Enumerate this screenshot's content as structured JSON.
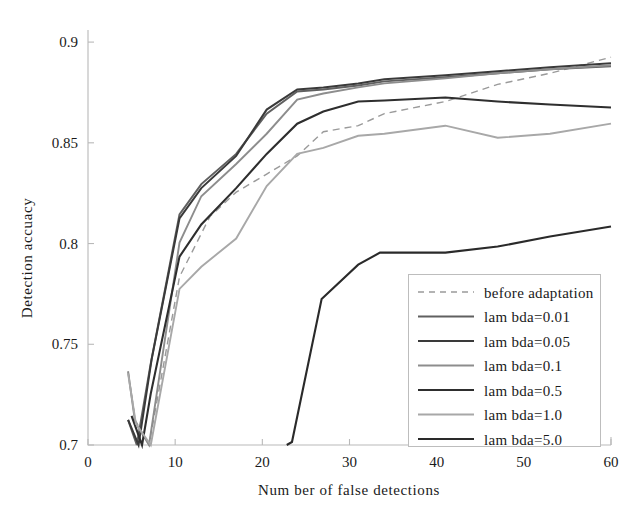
{
  "chart_data": {
    "type": "line",
    "title": "",
    "xlabel": "Num ber of false detections",
    "ylabel": "Detection accuacy",
    "xlim": [
      0,
      60
    ],
    "ylim": [
      0.7,
      0.906
    ],
    "xticks": [
      0,
      10,
      20,
      30,
      40,
      50,
      60
    ],
    "xticklabels": [
      "0",
      "10",
      "20",
      "30",
      "40",
      "50",
      "60"
    ],
    "yticks": [
      0.7,
      0.75,
      0.8,
      0.85,
      0.9
    ],
    "yticklabels": [
      "0.7",
      "0.75",
      "0.8",
      "0.85",
      "0.9"
    ],
    "grid": false,
    "legend_position": "lower right",
    "series": [
      {
        "name": "before adaptation",
        "color": "#9a9a9a",
        "style": "dashed",
        "width": 1.4,
        "x": [
          4.6,
          5.4,
          7.0,
          10.5,
          14.0,
          17.0,
          20.5,
          24.0,
          27.0,
          31.0,
          34.0,
          41.0,
          47.0,
          53.0,
          60.0
        ],
        "y": [
          0.7365,
          0.7125,
          0.7,
          0.7835,
          0.8135,
          0.8255,
          0.8345,
          0.8435,
          0.8555,
          0.8585,
          0.8645,
          0.8705,
          0.879,
          0.8845,
          0.8925
        ]
      },
      {
        "name": "lam bda=0.01",
        "color": "#606060",
        "style": "solid",
        "width": 2.0,
        "x": [
          4.6,
          5.6,
          7.2,
          10.5,
          13.0,
          17.0,
          20.5,
          24.0,
          27.0,
          31.0,
          34.0,
          41.0,
          47.0,
          53.0,
          60.0
        ],
        "y": [
          0.7125,
          0.7,
          0.7405,
          0.8145,
          0.8295,
          0.8445,
          0.8645,
          0.8755,
          0.8765,
          0.8785,
          0.8805,
          0.8825,
          0.8845,
          0.8865,
          0.888
        ]
      },
      {
        "name": "lam bda=0.05",
        "color": "#3a3a3a",
        "style": "solid",
        "width": 2.0,
        "x": [
          4.6,
          5.8,
          7.3,
          10.5,
          13.0,
          17.0,
          20.5,
          24.0,
          27.0,
          31.0,
          34.0,
          41.0,
          47.0,
          53.0,
          60.0
        ],
        "y": [
          0.7125,
          0.7,
          0.7425,
          0.8125,
          0.8275,
          0.8435,
          0.8665,
          0.8765,
          0.8775,
          0.8795,
          0.8815,
          0.8835,
          0.8855,
          0.8875,
          0.8895
        ]
      },
      {
        "name": "lam bda=0.1",
        "color": "#8d8d8d",
        "style": "solid",
        "width": 1.9,
        "x": [
          4.6,
          5.4,
          7.0,
          10.5,
          13.0,
          17.0,
          20.5,
          24.0,
          27.0,
          31.0,
          34.0,
          41.0,
          47.0,
          53.0,
          60.0
        ],
        "y": [
          0.7365,
          0.7115,
          0.7,
          0.8005,
          0.8235,
          0.8395,
          0.8545,
          0.8715,
          0.8745,
          0.8775,
          0.8795,
          0.882,
          0.8845,
          0.8865,
          0.8885
        ]
      },
      {
        "name": "lam bda=0.5",
        "color": "#2e2e2e",
        "style": "solid",
        "width": 2.1,
        "x": [
          5.0,
          6.2,
          7.2,
          10.5,
          13.0,
          17.0,
          20.5,
          24.0,
          27.0,
          31.0,
          34.0,
          41.0,
          47.0,
          53.0,
          60.0
        ],
        "y": [
          0.7145,
          0.7,
          0.7255,
          0.7935,
          0.8095,
          0.8275,
          0.8445,
          0.8595,
          0.8655,
          0.8705,
          0.871,
          0.8725,
          0.8705,
          0.869,
          0.8675
        ]
      },
      {
        "name": "lam bda=1.0",
        "color": "#a8a8a8",
        "style": "solid",
        "width": 1.9,
        "x": [
          4.6,
          5.5,
          7.2,
          10.5,
          13.0,
          17.0,
          20.5,
          24.0,
          27.0,
          31.0,
          34.0,
          41.0,
          47.0,
          53.0,
          60.0
        ],
        "y": [
          0.7355,
          0.7105,
          0.7,
          0.7775,
          0.7885,
          0.8025,
          0.8285,
          0.8445,
          0.8475,
          0.8535,
          0.8545,
          0.8585,
          0.8525,
          0.8545,
          0.8595
        ]
      },
      {
        "name": "lam bda=5.0",
        "color": "#2a2a2a",
        "style": "solid",
        "width": 2.1,
        "x": [
          22.8,
          23.4,
          26.8,
          31.0,
          33.5,
          41.0,
          47.0,
          53.0,
          60.0
        ],
        "y": [
          0.7,
          0.7015,
          0.7725,
          0.7895,
          0.7955,
          0.7955,
          0.7985,
          0.8035,
          0.8085
        ]
      }
    ]
  },
  "legend": {
    "entries": [
      {
        "label": "before adaptation"
      },
      {
        "label": "lam bda=0.01"
      },
      {
        "label": "lam bda=0.05"
      },
      {
        "label": "lam bda=0.1"
      },
      {
        "label": "lam bda=0.5"
      },
      {
        "label": "lam bda=1.0"
      },
      {
        "label": "lam bda=5.0"
      }
    ]
  },
  "colors": {
    "axis": "#b9b9b9",
    "text": "#1a1a1a",
    "background": "#ffffff",
    "legend_border": "#bdbdbd"
  }
}
